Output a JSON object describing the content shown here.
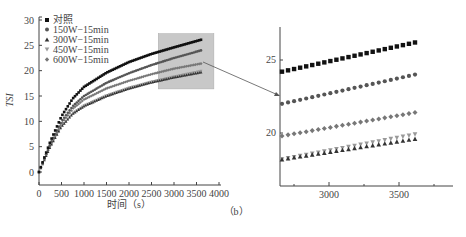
{
  "chart_data": [
    {
      "type": "scatter",
      "panel": "main",
      "title": "",
      "xlabel": "时间（s）",
      "ylabel": "TSI",
      "xlim": [
        0,
        4000
      ],
      "ylim": [
        0,
        30
      ],
      "xticks": [
        0,
        500,
        1000,
        1500,
        2000,
        2500,
        3000,
        3500,
        4000
      ],
      "yticks": [
        0,
        5,
        10,
        15,
        20,
        25,
        30
      ],
      "grid": false,
      "legend_position": "upper left",
      "legend": [
        "对照",
        "150W-15min",
        "300W-15min",
        "450W-15min",
        "600W-15min"
      ],
      "series": [
        {
          "name": "对照",
          "marker": "square",
          "color": "#111111",
          "x": [
            0,
            250,
            500,
            750,
            1000,
            1500,
            2000,
            2500,
            3000,
            3600
          ],
          "y": [
            0,
            6,
            11,
            14.5,
            16.8,
            19.6,
            21.7,
            23.3,
            24.6,
            26.1
          ]
        },
        {
          "name": "150W-15min",
          "marker": "circle",
          "color": "#555555",
          "x": [
            0,
            250,
            500,
            750,
            1000,
            1500,
            2000,
            2500,
            3000,
            3600
          ],
          "y": [
            0,
            5.5,
            10,
            13,
            15,
            17.6,
            19.5,
            21.1,
            22.5,
            24.0
          ]
        },
        {
          "name": "300W-15min",
          "marker": "triangle-up",
          "color": "#333333",
          "x": [
            0,
            250,
            500,
            750,
            1000,
            1500,
            2000,
            2500,
            3000,
            3600
          ],
          "y": [
            0,
            5,
            9,
            11.5,
            13,
            15,
            16.5,
            17.7,
            18.7,
            19.7
          ]
        },
        {
          "name": "450W-15min",
          "marker": "triangle-down",
          "color": "#999999",
          "x": [
            0,
            250,
            500,
            750,
            1000,
            1500,
            2000,
            2500,
            3000,
            3600
          ],
          "y": [
            0,
            5,
            9,
            11.6,
            13.1,
            15.1,
            16.6,
            17.8,
            18.8,
            19.9
          ]
        },
        {
          "name": "600W-15min",
          "marker": "diamond",
          "color": "#777777",
          "x": [
            0,
            250,
            500,
            750,
            1000,
            1500,
            2000,
            2500,
            3000,
            3600
          ],
          "y": [
            0,
            5.3,
            9.5,
            12.5,
            14.3,
            16.5,
            18,
            19.3,
            20.4,
            21.4
          ]
        }
      ],
      "annotations": [
        {
          "type": "highlight-rect",
          "x_range": [
            2650,
            3886
          ],
          "y_range": [
            16.4,
            27.3
          ],
          "color": "#c8c8c8"
        },
        {
          "type": "arrow",
          "from": "highlight-rect",
          "to": "inset"
        }
      ]
    },
    {
      "type": "scatter",
      "panel": "inset-zoom",
      "title": "",
      "xlabel": "",
      "ylabel": "",
      "xlim": [
        2650,
        3886
      ],
      "ylim": [
        16.4,
        27.3
      ],
      "xticks": [
        3000,
        3500
      ],
      "yticks": [
        20,
        25
      ],
      "grid": false,
      "series": [
        {
          "name": "对照",
          "marker": "square",
          "x_start": 2650,
          "x_end": 3600,
          "y_start": 24.2,
          "y_end": 26.2
        },
        {
          "name": "150W-15min",
          "marker": "circle",
          "x_start": 2650,
          "x_end": 3600,
          "y_start": 22.0,
          "y_end": 24.0
        },
        {
          "name": "600W-15min",
          "marker": "diamond",
          "x_start": 2650,
          "x_end": 3600,
          "y_start": 19.8,
          "y_end": 21.4
        },
        {
          "name": "300W-15min",
          "marker": "triangle-up",
          "x_start": 2650,
          "x_end": 3600,
          "y_start": 18.2,
          "y_end": 19.6
        },
        {
          "name": "450W-15min",
          "marker": "triangle-down",
          "x_start": 2650,
          "x_end": 3600,
          "y_start": 18.2,
          "y_end": 19.9
        }
      ]
    }
  ],
  "figure": {
    "caption": "（b）"
  },
  "main": {
    "ylabel": "TSI",
    "xlabel": "时间（s）",
    "xtick_labels": [
      "0",
      "500",
      "1000",
      "1500",
      "2000",
      "2500",
      "3000",
      "3500",
      "4000"
    ],
    "ytick_labels": [
      "0",
      "5",
      "10",
      "15",
      "20",
      "25",
      "30"
    ],
    "legend": [
      {
        "label": "对照",
        "marker": "■"
      },
      {
        "label": "150W−15min",
        "marker": "●"
      },
      {
        "label": "300W−15min",
        "marker": "▲"
      },
      {
        "label": "450W−15min",
        "marker": "▼"
      },
      {
        "label": "600W−15min",
        "marker": "◆"
      }
    ]
  },
  "inset": {
    "xtick_labels": [
      "3000",
      "3500"
    ],
    "ytick_labels": [
      "20",
      "25"
    ]
  },
  "colors": {
    "axis": "#444444",
    "highlight": "#c8c8c8",
    "control": "#111111",
    "w150": "#555555",
    "w300": "#333333",
    "w450": "#999999",
    "w600": "#777777"
  }
}
